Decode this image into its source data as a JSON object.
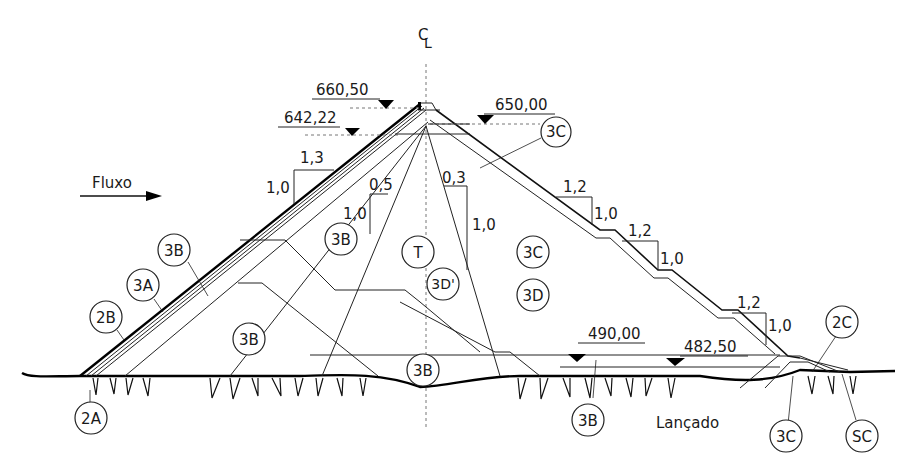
{
  "diagram": {
    "title_symbol": "CL",
    "flow_label": "Fluxo",
    "foundation_label": "Lançado",
    "elevations": {
      "crest": "660,50",
      "upstream_level": "642,22",
      "upstream_crest_side": "650,00",
      "downstream_level_1": "490,00",
      "downstream_level_2": "482,50"
    },
    "slopes": {
      "upstream_h": "1,3",
      "upstream_v": "1,0",
      "core_up_h": "0,5",
      "core_up_v": "1,0",
      "core_down_h": "0,3",
      "core_down_v": "1,0",
      "down1_h": "1,2",
      "down1_v": "1,0",
      "down2_h": "1,2",
      "down2_v": "1,0",
      "down3_h": "1,2",
      "down3_v": "1,0"
    },
    "zones": {
      "z_3c_top": "3C",
      "z_3b_upper": "3B",
      "z_t": "T",
      "z_3c_mid": "3C",
      "z_3b_left": "3B",
      "z_3a": "3A",
      "z_3dprime": "3D'",
      "z_3d": "3D",
      "z_2b": "2B",
      "z_3b_lower": "3B",
      "z_2c": "2C",
      "z_3b_base": "3B",
      "z_2a": "2A",
      "z_3b_foundation": "3B",
      "z_3c_toe": "3C",
      "z_sc": "SC"
    }
  }
}
